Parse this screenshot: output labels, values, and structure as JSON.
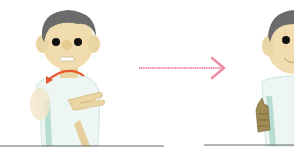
{
  "illustration": {
    "description": "Two-step sign language illustration: cartoon man performs gesture, arrow, then second pose",
    "colors": {
      "skin": "#f0dcae",
      "skin_shade": "#d9c08a",
      "hair": "#6b6b6b",
      "shirt": "#eef6f4",
      "shirt_shade": "#9fd3c5",
      "motion_arrow": "#e8562e",
      "transition_arrow": "#f08aa0",
      "baseline": "#666666"
    },
    "frames": [
      {
        "label": "step-1"
      },
      {
        "label": "step-2"
      }
    ]
  }
}
